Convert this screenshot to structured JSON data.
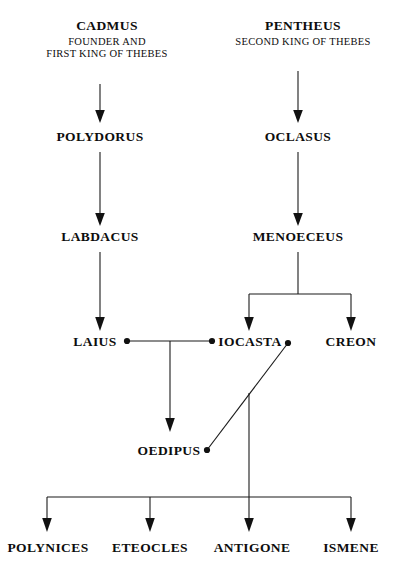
{
  "diagram": {
    "nodes": {
      "cadmus": {
        "name": "CADMUS",
        "sub1": "FOUNDER AND",
        "sub2": "FIRST KING OF THEBES"
      },
      "pentheus": {
        "name": "PENTHEUS",
        "sub1": "SECOND KING OF THEBES"
      },
      "polydorus": {
        "name": "POLYDORUS"
      },
      "oclasus": {
        "name": "OCLASUS"
      },
      "labdacus": {
        "name": "LABDACUS"
      },
      "menoeceus": {
        "name": "MENOECEUS"
      },
      "laius": {
        "name": "LAIUS"
      },
      "iocasta": {
        "name": "IOCASTA"
      },
      "creon": {
        "name": "CREON"
      },
      "oedipus": {
        "name": "OEDIPUS"
      },
      "polynices": {
        "name": "POLYNICES"
      },
      "eteocles": {
        "name": "ETEOCLES"
      },
      "antigone": {
        "name": "ANTIGONE"
      },
      "ismene": {
        "name": "ISMENE"
      }
    },
    "colors": {
      "ink": "#111111",
      "background": "#ffffff"
    }
  }
}
